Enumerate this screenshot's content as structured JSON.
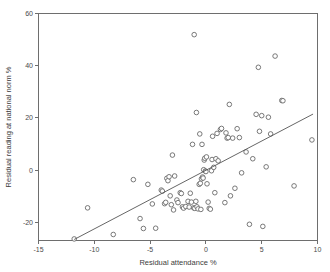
{
  "chart_data": {
    "type": "scatter",
    "title": "",
    "xlabel": "Residual attendance %",
    "ylabel": "Residual reading at national norm %",
    "xlim": [
      -15,
      10
    ],
    "ylim": [
      -27,
      60
    ],
    "xticks": [
      -15,
      -10,
      -5,
      0,
      5,
      10
    ],
    "yticks": [
      -20,
      0,
      20,
      40,
      60
    ],
    "xtick_labels": [
      "-15",
      "-10",
      "-5",
      "0",
      "5",
      "10"
    ],
    "ytick_labels": [
      "-20",
      "0",
      "20",
      "40",
      "60"
    ],
    "grid": false,
    "legend": null,
    "marker": "open-circle",
    "trendline": {
      "type": "linear-fit",
      "x_start": -11.8,
      "y_start": -26.5,
      "x_end": 9.6,
      "y_end": 21.5
    },
    "points": [
      [
        -11.8,
        -26.3
      ],
      [
        -10.6,
        -14.4
      ],
      [
        -8.3,
        -24.6
      ],
      [
        -6.5,
        -3.6
      ],
      [
        -5.9,
        -18.5
      ],
      [
        -5.6,
        -22.3
      ],
      [
        -5.2,
        -5.4
      ],
      [
        -4.8,
        -12.9
      ],
      [
        -4.5,
        -22.2
      ],
      [
        -4.0,
        -7.6
      ],
      [
        -3.9,
        -8.0
      ],
      [
        -3.7,
        -12.8
      ],
      [
        -3.6,
        -12.3
      ],
      [
        -3.5,
        -3.1
      ],
      [
        -3.4,
        -4.0
      ],
      [
        -3.3,
        -2.5
      ],
      [
        -3.2,
        -9.8
      ],
      [
        -3.1,
        -13.2
      ],
      [
        -3.0,
        5.8
      ],
      [
        -2.9,
        -15.2
      ],
      [
        -2.8,
        -2.2
      ],
      [
        -2.6,
        -11.4
      ],
      [
        -2.5,
        -12.4
      ],
      [
        -2.3,
        -8.6
      ],
      [
        -2.2,
        -8.9
      ],
      [
        -2.1,
        -14.0
      ],
      [
        -2.0,
        -14.5
      ],
      [
        -1.8,
        -13.9
      ],
      [
        -1.6,
        -11.9
      ],
      [
        -1.5,
        -14.1
      ],
      [
        -1.4,
        -8.8
      ],
      [
        -1.3,
        -12.2
      ],
      [
        -1.2,
        9.9
      ],
      [
        -1.1,
        -14.4
      ],
      [
        -1.05,
        51.9
      ],
      [
        -1.0,
        -14.6
      ],
      [
        -0.9,
        -11.9
      ],
      [
        -0.85,
        22.1
      ],
      [
        -0.8,
        -14.0
      ],
      [
        -0.7,
        -14.8
      ],
      [
        -0.6,
        -5.4
      ],
      [
        -0.55,
        13.9
      ],
      [
        -0.5,
        -5.0
      ],
      [
        -0.45,
        -15.0
      ],
      [
        -0.4,
        -3.3
      ],
      [
        -0.35,
        9.9
      ],
      [
        -0.3,
        -2.6
      ],
      [
        -0.25,
        -3.0
      ],
      [
        -0.2,
        0.2
      ],
      [
        -0.15,
        3.9
      ],
      [
        -0.1,
        4.6
      ],
      [
        -0.05,
        -0.3
      ],
      [
        0.0,
        -0.5
      ],
      [
        0.05,
        5.1
      ],
      [
        0.1,
        -5.2
      ],
      [
        0.2,
        -12.2
      ],
      [
        0.3,
        -14.6
      ],
      [
        0.4,
        -14.9
      ],
      [
        0.5,
        -0.2
      ],
      [
        0.55,
        4.1
      ],
      [
        0.6,
        13.0
      ],
      [
        0.7,
        1.1
      ],
      [
        0.8,
        -8.6
      ],
      [
        0.9,
        4.4
      ],
      [
        1.0,
        14.1
      ],
      [
        1.1,
        3.6
      ],
      [
        1.3,
        15.6
      ],
      [
        1.4,
        16.0
      ],
      [
        1.7,
        -12.4
      ],
      [
        1.8,
        14.3
      ],
      [
        1.9,
        12.3
      ],
      [
        2.0,
        12.5
      ],
      [
        2.1,
        25.2
      ],
      [
        2.2,
        -9.8
      ],
      [
        2.4,
        12.3
      ],
      [
        2.6,
        -6.9
      ],
      [
        2.8,
        15.9
      ],
      [
        3.0,
        12.5
      ],
      [
        3.2,
        -1.0
      ],
      [
        3.6,
        7.0
      ],
      [
        3.9,
        -20.7
      ],
      [
        4.2,
        4.4
      ],
      [
        4.5,
        21.4
      ],
      [
        4.7,
        39.4
      ],
      [
        4.8,
        14.9
      ],
      [
        5.0,
        20.9
      ],
      [
        5.1,
        -21.5
      ],
      [
        5.4,
        1.3
      ],
      [
        5.6,
        20.3
      ],
      [
        5.8,
        13.9
      ],
      [
        6.2,
        43.7
      ],
      [
        6.8,
        26.7
      ],
      [
        6.9,
        26.6
      ],
      [
        7.9,
        -6.0
      ],
      [
        9.5,
        11.6
      ]
    ]
  }
}
